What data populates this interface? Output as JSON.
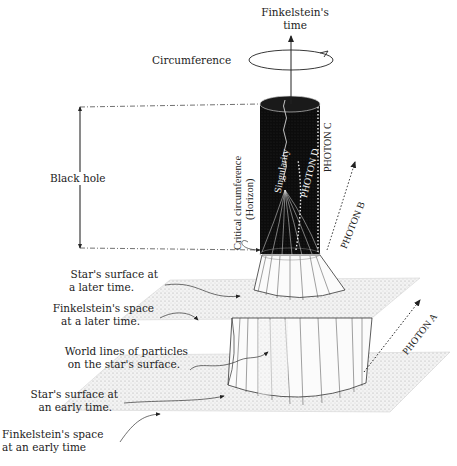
{
  "diagram": {
    "top_axis": {
      "label_line1": "Finkelstein's",
      "label_line2": "time",
      "circumference_label": "Circumference"
    },
    "black_hole_label": "Black hole",
    "horizon_label_line1": "Critical circumference",
    "horizon_label_line2": "(Horizon)",
    "singularity_label": "Singularity",
    "photons": {
      "a": "PHOTON A",
      "b": "PHOTON B",
      "c": "PHOTON C",
      "d": "PHOTON D"
    },
    "left_labels": [
      {
        "line1": "Star's surface at",
        "line2": "a later time."
      },
      {
        "line1": "Finkelstein's space",
        "line2": "at a later time."
      },
      {
        "line1": "World lines of particles",
        "line2": "on the star's surface."
      },
      {
        "line1": "Star's surface at",
        "line2": "an early time."
      },
      {
        "line1": "Finkelstein's space",
        "line2": "at an early time"
      }
    ],
    "colors": {
      "ink": "#222222",
      "black_hole_fill": "#0d0d0d",
      "plane_fill": "#e6e6e6",
      "background": "#ffffff"
    }
  }
}
